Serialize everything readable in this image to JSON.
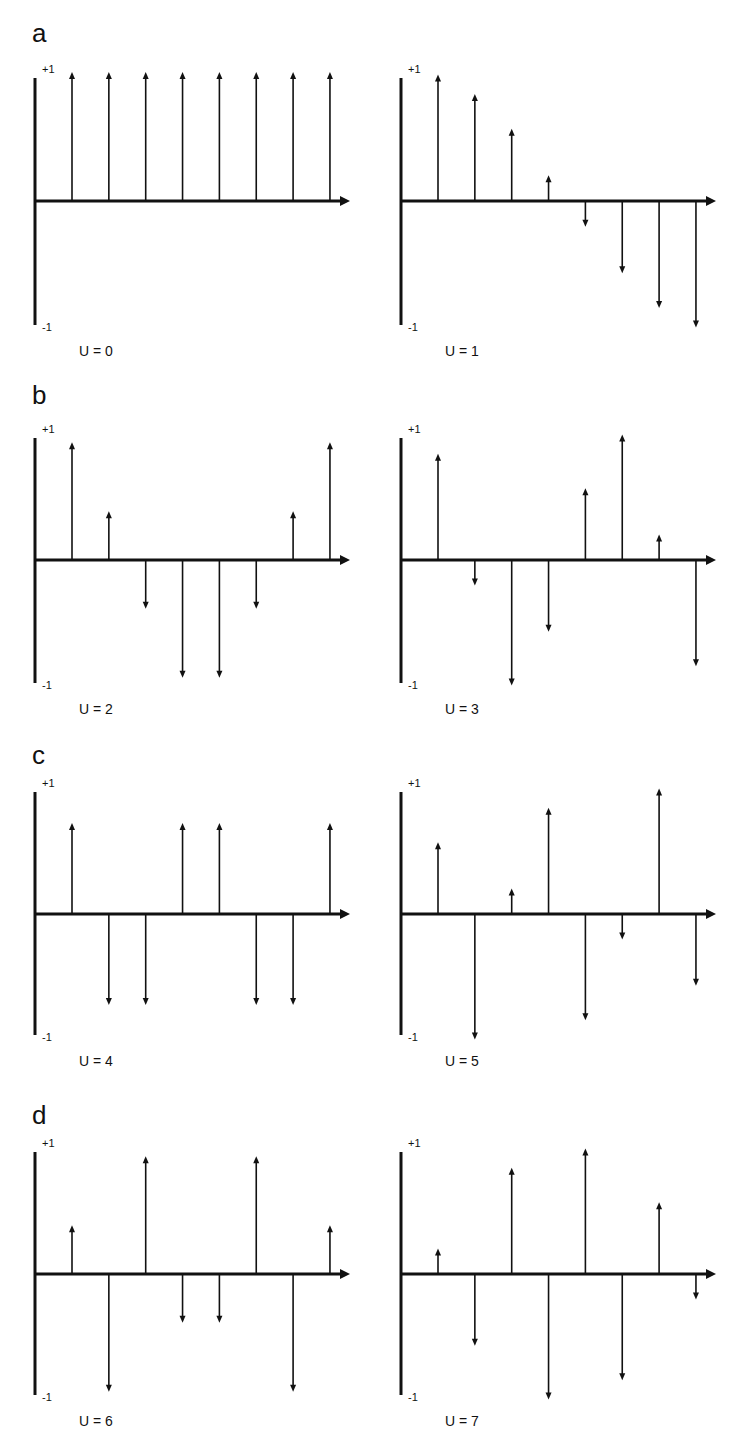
{
  "figure": {
    "rows": [
      {
        "letter": "a"
      },
      {
        "letter": "b"
      },
      {
        "letter": "c"
      },
      {
        "letter": "d"
      }
    ],
    "axis_labels": {
      "top": "+1",
      "bottom": "-1"
    }
  },
  "chart_data": [
    {
      "type": "stem",
      "title": "U = 0",
      "panel": "a-left",
      "x": [
        0,
        1,
        2,
        3,
        4,
        5,
        6,
        7
      ],
      "values": [
        1,
        1,
        1,
        1,
        1,
        1,
        1,
        1
      ],
      "ylim": [
        -1,
        1
      ],
      "yticks": [
        "+1",
        "-1"
      ]
    },
    {
      "type": "stem",
      "title": "U = 1",
      "panel": "a-right",
      "x": [
        0,
        1,
        2,
        3,
        4,
        5,
        6,
        7
      ],
      "values": [
        0.98,
        0.83,
        0.56,
        0.2,
        -0.2,
        -0.56,
        -0.83,
        -0.98
      ],
      "ylim": [
        -1,
        1
      ],
      "yticks": [
        "+1",
        "-1"
      ]
    },
    {
      "type": "stem",
      "title": "U = 2",
      "panel": "b-left",
      "x": [
        0,
        1,
        2,
        3,
        4,
        5,
        6,
        7
      ],
      "values": [
        0.92,
        0.38,
        -0.38,
        -0.92,
        -0.92,
        -0.38,
        0.38,
        0.92
      ],
      "ylim": [
        -1,
        1
      ],
      "yticks": [
        "+1",
        "-1"
      ]
    },
    {
      "type": "stem",
      "title": "U = 3",
      "panel": "b-right",
      "x": [
        0,
        1,
        2,
        3,
        4,
        5,
        6,
        7
      ],
      "values": [
        0.83,
        -0.2,
        -0.98,
        -0.56,
        0.56,
        0.98,
        0.2,
        -0.83
      ],
      "ylim": [
        -1,
        1
      ],
      "yticks": [
        "+1",
        "-1"
      ]
    },
    {
      "type": "stem",
      "title": "U = 4",
      "panel": "c-left",
      "x": [
        0,
        1,
        2,
        3,
        4,
        5,
        6,
        7
      ],
      "values": [
        0.71,
        -0.71,
        -0.71,
        0.71,
        0.71,
        -0.71,
        -0.71,
        0.71
      ],
      "ylim": [
        -1,
        1
      ],
      "yticks": [
        "+1",
        "-1"
      ]
    },
    {
      "type": "stem",
      "title": "U = 5",
      "panel": "c-right",
      "x": [
        0,
        1,
        2,
        3,
        4,
        5,
        6,
        7
      ],
      "values": [
        0.56,
        -0.98,
        0.2,
        0.83,
        -0.83,
        -0.2,
        0.98,
        -0.56
      ],
      "ylim": [
        -1,
        1
      ],
      "yticks": [
        "+1",
        "-1"
      ]
    },
    {
      "type": "stem",
      "title": "U = 6",
      "panel": "d-left",
      "x": [
        0,
        1,
        2,
        3,
        4,
        5,
        6,
        7
      ],
      "values": [
        0.38,
        -0.92,
        0.92,
        -0.38,
        -0.38,
        0.92,
        -0.92,
        0.38
      ],
      "ylim": [
        -1,
        1
      ],
      "yticks": [
        "+1",
        "-1"
      ]
    },
    {
      "type": "stem",
      "title": "U = 7",
      "panel": "d-right",
      "x": [
        0,
        1,
        2,
        3,
        4,
        5,
        6,
        7
      ],
      "values": [
        0.2,
        -0.56,
        0.83,
        -0.98,
        0.98,
        -0.83,
        0.56,
        -0.2
      ],
      "ylim": [
        -1,
        1
      ],
      "yticks": [
        "+1",
        "-1"
      ]
    }
  ]
}
